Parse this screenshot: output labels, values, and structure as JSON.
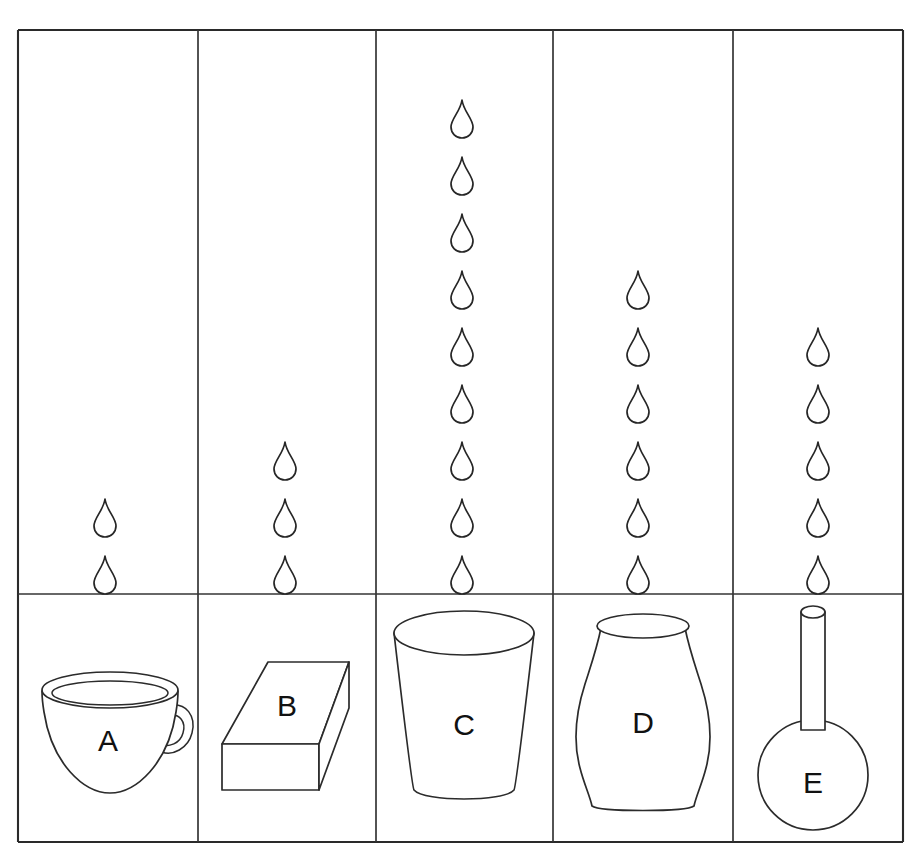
{
  "figure": {
    "type": "comparison-grid",
    "background_color": "#ffffff",
    "line_color": "#2b2b2b",
    "drop_icon": "water-drop-icon",
    "rows": 2,
    "columns": 5,
    "grid": {
      "left": 18,
      "right": 903,
      "top": 30,
      "bottom": 842,
      "divider_y": 594,
      "column_dividers": [
        198,
        376,
        553,
        733
      ]
    }
  },
  "columns": [
    {
      "id": "A",
      "label": "A",
      "vessel": "teacup",
      "vessel_name": "cup-a",
      "drop_count": 2,
      "drop_center_x": 105,
      "drop_bottom_y": 575,
      "cell_center_x": 108
    },
    {
      "id": "B",
      "label": "B",
      "vessel": "rectangular-box",
      "vessel_name": "box-b",
      "drop_count": 3,
      "drop_center_x": 285,
      "drop_bottom_y": 575,
      "cell_center_x": 287
    },
    {
      "id": "C",
      "label": "C",
      "vessel": "tapered-glass",
      "vessel_name": "glass-c",
      "drop_count": 9,
      "drop_center_x": 462,
      "drop_bottom_y": 575,
      "cell_center_x": 464
    },
    {
      "id": "D",
      "label": "D",
      "vessel": "vase",
      "vessel_name": "vase-d",
      "drop_count": 6,
      "drop_center_x": 638,
      "drop_bottom_y": 575,
      "cell_center_x": 643
    },
    {
      "id": "E",
      "label": "E",
      "vessel": "round-bottom-flask",
      "vessel_name": "flask-e",
      "drop_count": 5,
      "drop_center_x": 818,
      "drop_bottom_y": 575,
      "cell_center_x": 818
    }
  ],
  "chart_data": {
    "type": "bar",
    "title": "",
    "xlabel": "",
    "ylabel": "",
    "categories": [
      "A",
      "B",
      "C",
      "D",
      "E"
    ],
    "values": [
      2,
      3,
      9,
      6,
      5
    ],
    "value_unit": "water drops",
    "series": [
      {
        "name": "water drops",
        "values": [
          2,
          3,
          9,
          6,
          5
        ]
      }
    ],
    "category_items": [
      "cup",
      "box",
      "glass",
      "vase",
      "flask"
    ],
    "grid": false,
    "legend": "none"
  },
  "drop_geometry": {
    "width": 22,
    "height": 38,
    "vertical_pitch": 57
  }
}
